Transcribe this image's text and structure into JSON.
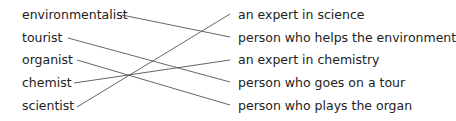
{
  "exercise": {
    "left_words": [
      {
        "label": "environmentalist"
      },
      {
        "label": "tourist"
      },
      {
        "label": "organist"
      },
      {
        "label": "chemist"
      },
      {
        "label": "scientist"
      }
    ],
    "right_definitions": [
      {
        "label": "an expert in science"
      },
      {
        "label": "person who helps the environment"
      },
      {
        "label": "an expert in chemistry"
      },
      {
        "label": "person who goes on a tour"
      },
      {
        "label": "person who plays the organ"
      }
    ],
    "matches": [
      {
        "left": "environmentalist",
        "right": "person who helps the environment"
      },
      {
        "left": "tourist",
        "right": "person who goes on a tour"
      },
      {
        "left": "organist",
        "right": "person who plays the organ"
      },
      {
        "left": "chemist",
        "right": "an expert in chemistry"
      },
      {
        "left": "scientist",
        "right": "an expert in science"
      }
    ],
    "line_color": "#555555"
  }
}
